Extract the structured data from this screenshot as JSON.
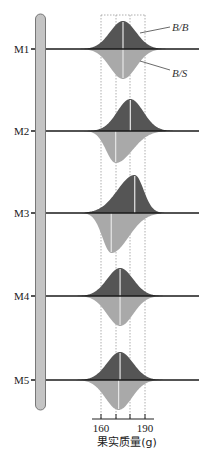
{
  "figure": {
    "type": "qtl-genotype-distribution-diagram",
    "colors": {
      "bb_fill": "#555555",
      "bs_fill": "#a9a9a9",
      "chromosome_fill": "#c4c4c4",
      "chromosome_stroke": "#777777",
      "baseline": "#1a1a1a",
      "guide": "#999999",
      "mean_line": "#e6e6e6"
    },
    "legend": {
      "top": "B/B",
      "bottom": "B/S"
    },
    "markers": [
      {
        "label": "M1",
        "bb_peak": 175,
        "bb_height": 28,
        "bs_peak": 175,
        "bs_depth": 30,
        "skew_top": 0,
        "skew_bottom": 0
      },
      {
        "label": "M2",
        "bb_peak": 180,
        "bb_height": 32,
        "bs_peak": 170,
        "bs_depth": 32,
        "skew_top": 0,
        "skew_bottom": 0.6
      },
      {
        "label": "M3",
        "bb_peak": 183,
        "bb_height": 38,
        "bs_peak": 167,
        "bs_depth": 40,
        "skew_top": -0.7,
        "skew_bottom": 0.7
      },
      {
        "label": "M4",
        "bb_peak": 173,
        "bb_height": 28,
        "bs_peak": 173,
        "bs_depth": 30,
        "skew_top": 0,
        "skew_bottom": 0
      },
      {
        "label": "M5",
        "bb_peak": 173,
        "bb_height": 28,
        "bs_peak": 172,
        "bs_depth": 30,
        "skew_top": 0,
        "skew_bottom": 0
      }
    ],
    "axis": {
      "ticks": [
        160,
        170,
        180,
        190
      ],
      "tick_labels_shown": [
        "160",
        "190"
      ],
      "title": "果实质量(g)"
    }
  }
}
